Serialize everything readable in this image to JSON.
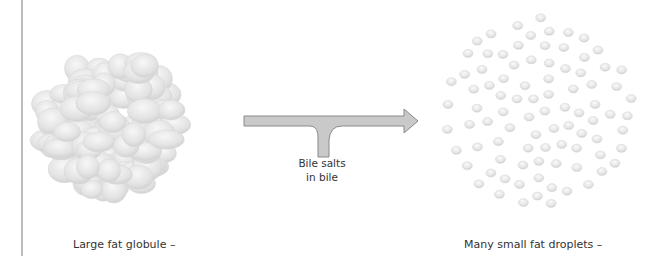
{
  "diagram": {
    "left_label": "Large fat globule –",
    "right_label": "Many small fat droplets –",
    "bile_label_line1": "Bile salts",
    "bile_label_line2": "in bile",
    "colors": {
      "arrow_fill": "#c8c8c8",
      "arrow_stroke": "#8a8a8a",
      "globule_fill": "#e6e6e6",
      "globule_stroke": "#d0d0d0",
      "text": "#333333",
      "border_line": "#bdbdbd"
    }
  }
}
